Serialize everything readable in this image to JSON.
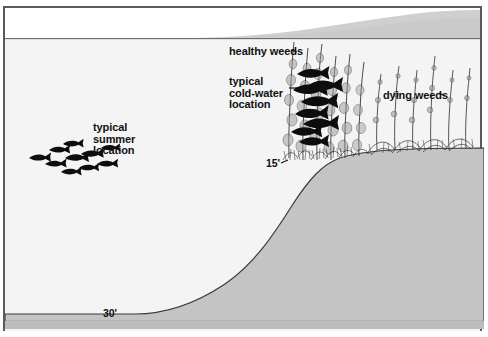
{
  "diagram": {
    "type": "cross-section-illustration"
  },
  "labels": {
    "healthy_weeds": "healthy weeds",
    "cold_water_location": "typical\ncold-water\nlocation",
    "dying_weeds": "dying weeds",
    "summer_location": "typical\nsummer\nlocation"
  },
  "depth_markers": {
    "shallow": "15'",
    "deep": "30'"
  },
  "colors": {
    "water": "#f4f4f4",
    "bottom": "#c4c4c4",
    "sky": "#ffffff",
    "far_shore": "#cfcfcf",
    "ink": "#101010",
    "frame": "#5a5a5a",
    "sediment": "#bdbdbd"
  },
  "elements": {
    "fish_school_summer": "fish-school-silhouette",
    "fish_school_coldwater": "fish-school-silhouette",
    "weedbed_healthy": "weedbed-tall-healthy",
    "weedbed_dying": "weedbed-sparse-dying",
    "lake_bottom": "lake-bottom-slope",
    "water_surface": "water-surface-line"
  }
}
